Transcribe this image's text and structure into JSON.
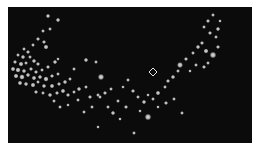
{
  "image": {
    "description": "Dark field with scattered bright particles forming a curved arc, with a small diamond marker",
    "background_color": "#0b0b0b",
    "particle_color": "#d8d8d8",
    "marker": {
      "icon": "crosshair-diamond-icon",
      "x": 145,
      "y": 65
    }
  },
  "particles": [
    [
      40,
      9,
      1.6
    ],
    [
      50,
      13,
      1.6
    ],
    [
      35,
      24,
      1.4
    ],
    [
      42,
      22,
      1.4
    ],
    [
      30,
      32,
      1.5
    ],
    [
      36,
      35,
      1.5
    ],
    [
      25,
      38,
      1.4
    ],
    [
      38,
      40,
      1.8
    ],
    [
      47,
      55,
      1.6
    ],
    [
      50,
      52,
      1.3
    ],
    [
      16,
      42,
      1.4
    ],
    [
      20,
      45,
      1.5
    ],
    [
      10,
      48,
      1.4
    ],
    [
      15,
      50,
      1.6
    ],
    [
      22,
      50,
      1.4
    ],
    [
      7,
      55,
      1.5
    ],
    [
      13,
      57,
      1.8
    ],
    [
      18,
      56,
      1.4
    ],
    [
      26,
      54,
      1.6
    ],
    [
      30,
      57,
      1.5
    ],
    [
      5,
      62,
      1.7
    ],
    [
      10,
      63,
      1.9
    ],
    [
      16,
      64,
      1.6
    ],
    [
      23,
      62,
      1.5
    ],
    [
      28,
      65,
      1.5
    ],
    [
      34,
      63,
      1.4
    ],
    [
      40,
      60,
      1.5
    ],
    [
      8,
      69,
      1.8
    ],
    [
      14,
      70,
      2.0
    ],
    [
      20,
      68,
      1.6
    ],
    [
      26,
      71,
      1.7
    ],
    [
      32,
      70,
      1.6
    ],
    [
      38,
      72,
      1.9
    ],
    [
      44,
      69,
      1.5
    ],
    [
      50,
      67,
      1.4
    ],
    [
      12,
      76,
      1.7
    ],
    [
      18,
      77,
      1.6
    ],
    [
      25,
      78,
      1.8
    ],
    [
      30,
      75,
      1.4
    ],
    [
      36,
      79,
      1.6
    ],
    [
      44,
      79,
      1.7
    ],
    [
      51,
      77,
      1.5
    ],
    [
      57,
      75,
      1.6
    ],
    [
      62,
      72,
      1.4
    ],
    [
      28,
      85,
      1.5
    ],
    [
      35,
      86,
      1.4
    ],
    [
      42,
      88,
      1.6
    ],
    [
      49,
      86,
      1.5
    ],
    [
      55,
      84,
      1.7
    ],
    [
      60,
      88,
      1.5
    ],
    [
      66,
      85,
      1.4
    ],
    [
      71,
      82,
      1.6
    ],
    [
      78,
      80,
      1.4
    ],
    [
      70,
      93,
      1.4
    ],
    [
      82,
      90,
      1.5
    ],
    [
      90,
      88,
      1.4
    ],
    [
      97,
      86,
      1.5
    ],
    [
      103,
      82,
      1.4
    ],
    [
      76,
      105,
      1.4
    ],
    [
      66,
      62,
      1.4
    ],
    [
      78,
      53,
      1.6
    ],
    [
      88,
      55,
      1.4
    ],
    [
      93,
      70,
      2.3
    ],
    [
      92,
      90,
      1.4
    ],
    [
      100,
      100,
      1.4
    ],
    [
      105,
      106,
      1.6
    ],
    [
      110,
      94,
      1.4
    ],
    [
      140,
      88,
      1.3
    ],
    [
      120,
      73,
      1.4
    ],
    [
      115,
      80,
      1.3
    ],
    [
      125,
      84,
      1.5
    ],
    [
      130,
      90,
      1.4
    ],
    [
      136,
      95,
      1.6
    ],
    [
      145,
      92,
      1.4
    ],
    [
      150,
      86,
      1.7
    ],
    [
      157,
      80,
      1.4
    ],
    [
      160,
      74,
      1.5
    ],
    [
      165,
      70,
      1.6
    ],
    [
      170,
      64,
      1.4
    ],
    [
      172,
      58,
      2.2
    ],
    [
      178,
      52,
      1.5
    ],
    [
      185,
      46,
      1.4
    ],
    [
      190,
      40,
      1.6
    ],
    [
      194,
      36,
      1.5
    ],
    [
      198,
      44,
      1.8
    ],
    [
      205,
      48,
      2.4
    ],
    [
      200,
      56,
      1.4
    ],
    [
      196,
      60,
      1.5
    ],
    [
      188,
      58,
      1.4
    ],
    [
      182,
      64,
      1.3
    ],
    [
      210,
      40,
      1.5
    ],
    [
      208,
      30,
      1.4
    ],
    [
      202,
      26,
      1.5
    ],
    [
      196,
      20,
      1.4
    ],
    [
      210,
      22,
      1.6
    ],
    [
      200,
      14,
      1.5
    ],
    [
      205,
      8,
      1.4
    ],
    [
      212,
      14,
      1.3
    ],
    [
      140,
      110,
      2.4
    ],
    [
      126,
      126,
      1.4
    ],
    [
      90,
      120,
      1.3
    ],
    [
      150,
      100,
      1.3
    ],
    [
      158,
      96,
      1.5
    ],
    [
      166,
      92,
      1.4
    ],
    [
      112,
      112,
      1.3
    ],
    [
      174,
      106,
      1.4
    ],
    [
      60,
      98,
      1.3
    ],
    [
      52,
      100,
      1.4
    ],
    [
      46,
      94,
      1.4
    ],
    [
      84,
      100,
      1.4
    ],
    [
      118,
      100,
      1.5
    ],
    [
      132,
      104,
      1.3
    ]
  ]
}
